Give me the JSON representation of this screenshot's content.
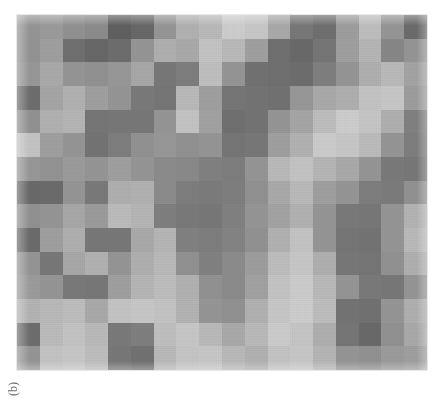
{
  "figure": {
    "caption_label": "(b)",
    "caption_rotation_deg": -90,
    "panel_background": "#9a9a9a",
    "page_background": "#ffffff"
  },
  "chart_data": {
    "type": "heatmap",
    "title": "",
    "subtitle": "",
    "xlabel": "",
    "ylabel": "",
    "annotations": [
      "(b)"
    ],
    "legend": [],
    "grid": false,
    "colormap": "grayscale",
    "value_range": [
      0,
      255
    ],
    "value_meaning": "8-bit grayscale intensity (0 = black, 255 = white)",
    "rows": 15,
    "cols": 18,
    "x_tick_labels": [],
    "y_tick_labels": [],
    "values": [
      [
        150,
        156,
        146,
        140,
        96,
        104,
        150,
        178,
        186,
        206,
        200,
        170,
        120,
        112,
        158,
        190,
        150,
        108
      ],
      [
        148,
        160,
        112,
        104,
        110,
        150,
        176,
        170,
        196,
        186,
        160,
        112,
        106,
        118,
        160,
        182,
        136,
        150
      ],
      [
        152,
        170,
        150,
        146,
        152,
        168,
        120,
        126,
        192,
        150,
        114,
        112,
        110,
        128,
        150,
        176,
        186,
        164
      ],
      [
        110,
        166,
        178,
        160,
        150,
        122,
        118,
        186,
        160,
        118,
        116,
        114,
        152,
        170,
        176,
        196,
        200,
        158
      ],
      [
        146,
        178,
        182,
        118,
        120,
        120,
        150,
        196,
        162,
        112,
        116,
        150,
        166,
        190,
        206,
        198,
        176,
        130
      ],
      [
        196,
        160,
        150,
        116,
        126,
        146,
        152,
        146,
        150,
        118,
        120,
        160,
        178,
        204,
        200,
        188,
        150,
        126
      ],
      [
        152,
        148,
        156,
        150,
        160,
        150,
        140,
        138,
        130,
        126,
        150,
        186,
        196,
        182,
        170,
        150,
        122,
        120
      ],
      [
        106,
        108,
        150,
        122,
        176,
        178,
        140,
        126,
        124,
        128,
        146,
        170,
        186,
        160,
        150,
        126,
        124,
        146
      ],
      [
        146,
        150,
        168,
        156,
        188,
        182,
        128,
        122,
        120,
        130,
        150,
        164,
        178,
        150,
        122,
        120,
        150,
        180
      ],
      [
        108,
        160,
        176,
        120,
        120,
        170,
        182,
        130,
        126,
        132,
        146,
        178,
        196,
        150,
        118,
        116,
        150,
        186
      ],
      [
        150,
        120,
        168,
        178,
        150,
        176,
        186,
        146,
        130,
        140,
        158,
        190,
        200,
        176,
        120,
        118,
        146,
        176
      ],
      [
        156,
        150,
        122,
        120,
        160,
        182,
        190,
        178,
        146,
        140,
        162,
        196,
        204,
        186,
        150,
        122,
        120,
        150
      ],
      [
        180,
        186,
        190,
        170,
        196,
        200,
        196,
        180,
        150,
        146,
        178,
        200,
        206,
        190,
        116,
        114,
        150,
        176
      ],
      [
        110,
        188,
        196,
        186,
        122,
        128,
        192,
        200,
        186,
        170,
        186,
        204,
        198,
        176,
        118,
        106,
        146,
        170
      ],
      [
        150,
        196,
        200,
        190,
        120,
        114,
        186,
        198,
        200,
        186,
        178,
        196,
        200,
        182,
        150,
        146,
        156,
        160
      ]
    ]
  }
}
